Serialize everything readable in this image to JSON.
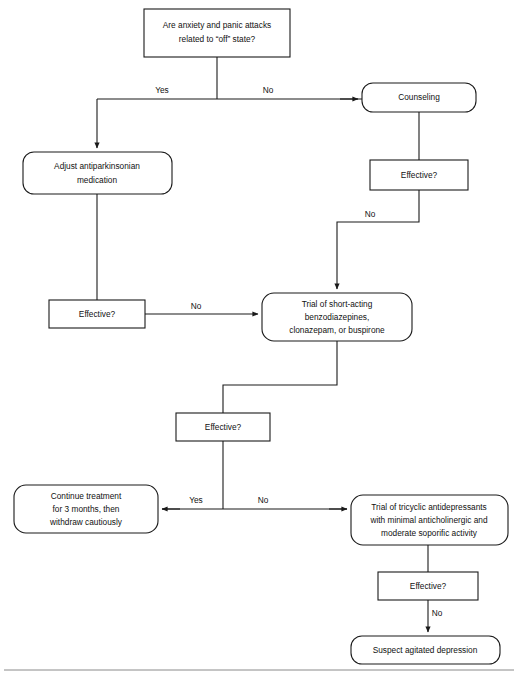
{
  "diagram": {
    "background_color": "#ffffff",
    "line_color": "#1a1a1a",
    "text_color": "#111111",
    "rule_color": "#8a8a8a"
  },
  "nodes": {
    "root_question": {
      "shape": "rectangle",
      "lines": [
        "Are anxiety and panic attacks",
        "related to “off” state?"
      ]
    },
    "adjust_medication": {
      "shape": "rounded",
      "lines": [
        "Adjust antiparkinsonian",
        "medication"
      ]
    },
    "counseling": {
      "shape": "rounded",
      "lines": [
        "Counseling"
      ]
    },
    "effective_counseling": {
      "shape": "rectangle",
      "lines": [
        "Effective?"
      ]
    },
    "effective_medication": {
      "shape": "rectangle",
      "lines": [
        "Effective?"
      ]
    },
    "trial_benzodiazepines": {
      "shape": "rounded",
      "lines": [
        "Trial of short-acting",
        "benzodiazepines,",
        "clonazepam, or buspirone"
      ]
    },
    "effective_benzodiazepines": {
      "shape": "rectangle",
      "lines": [
        "Effective?"
      ]
    },
    "continue_treatment": {
      "shape": "rounded",
      "lines": [
        "Continue treatment",
        "for 3 months, then",
        "withdraw cautiously"
      ]
    },
    "trial_tricyclic": {
      "shape": "rounded",
      "lines": [
        "Trial of tricyclic antidepressants",
        "with minimal anticholinergic and",
        "moderate soporific activity"
      ]
    },
    "effective_tricyclic": {
      "shape": "rectangle",
      "lines": [
        "Effective?"
      ]
    },
    "suspect_depression": {
      "shape": "rounded",
      "lines": [
        "Suspect agitated depression"
      ]
    }
  },
  "edge_labels": {
    "root_yes": "Yes",
    "root_no": "No",
    "counseling_no": "No",
    "medication_no": "No",
    "benzo_yes": "Yes",
    "benzo_no": "No",
    "tricyclic_no": "No"
  }
}
